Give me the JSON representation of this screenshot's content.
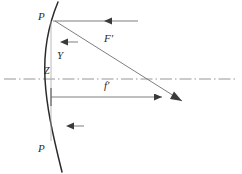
{
  "figure": {
    "type": "optical-ray-diagram",
    "background_color": "#ffffff",
    "line_color": "#3a3a3a",
    "axis_color": "#7d7d7d",
    "curve_color": "#2b2b2b",
    "labels": {
      "p_top": "P",
      "p_bottom": "P",
      "vertex": "Z",
      "height": "Y",
      "focal_point": "F'",
      "focal_length": "f'"
    },
    "elements": {
      "optical_axis": "dash-dot horizontal center line",
      "lens_surface": "convex curved refracting surface",
      "incident_ray": "horizontal ray entering at P",
      "refracted_ray": "diagonal ray from P crossing axis at F'",
      "focal_dimension": "f' dimension line from vertex to focal point",
      "aperture_markers": "two left-pointing arrow markers"
    },
    "geometry": {
      "axis_y": 79,
      "vertex_x": 45,
      "p_top_y": 21,
      "p_bottom_y": 139,
      "focus_x": 168,
      "ray_end_x": 182
    }
  }
}
